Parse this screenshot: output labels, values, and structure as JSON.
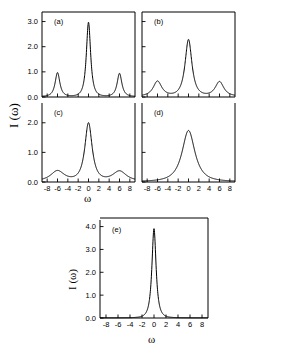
{
  "figure": {
    "ylabel": "I (ω)",
    "xlabel": "ω",
    "panels": [
      {
        "tag": "(a)"
      },
      {
        "tag": "(b)"
      },
      {
        "tag": "(c)"
      },
      {
        "tag": "(d)"
      },
      {
        "tag": "(e)"
      }
    ],
    "xticklabels": [
      "-8",
      "-6",
      "-4",
      "-2",
      "0",
      "2",
      "4",
      "6",
      "8"
    ],
    "yticklabels_top": [
      "0.0",
      "1.0",
      "2.0",
      "3.0"
    ],
    "yticklabels_bottom": [
      "0.0",
      "1.0",
      "2.0"
    ],
    "yticklabels_e": [
      "0.0",
      "1.0",
      "2.0",
      "3.0",
      "4.0"
    ]
  },
  "chart_data": {
    "type": "line",
    "title": "",
    "xlabel": "ω",
    "ylabel": "I (ω)",
    "xlim": [
      -9,
      9
    ],
    "xticks": [
      -8,
      -6,
      -4,
      -2,
      0,
      2,
      4,
      6,
      8
    ],
    "grid": false,
    "legend": null,
    "panels": [
      {
        "tag": "(a)",
        "ylim": [
          0,
          3.3
        ],
        "yticks": [
          0.0,
          1.0,
          2.0,
          3.0
        ],
        "description": "Well-resolved Mollow triplet: tall narrow central peak with two sharp symmetric sidebands",
        "peaks": [
          {
            "center": -6.0,
            "height": 0.95,
            "halfwidth": 0.55
          },
          {
            "center": 0.0,
            "height": 2.95,
            "halfwidth": 0.5
          },
          {
            "center": 6.0,
            "height": 0.92,
            "halfwidth": 0.55
          }
        ],
        "baseline": 0.02
      },
      {
        "tag": "(b)",
        "ylim": [
          0,
          3.3
        ],
        "yticks": [
          0.0,
          1.0,
          2.0,
          3.0
        ],
        "description": "Triplet with broadened, reduced central peak and lower sidebands",
        "peaks": [
          {
            "center": -6.0,
            "height": 0.6,
            "halfwidth": 1.0
          },
          {
            "center": 0.0,
            "height": 2.25,
            "halfwidth": 0.8
          },
          {
            "center": 6.0,
            "height": 0.58,
            "halfwidth": 1.0
          }
        ],
        "baseline": 0.03
      },
      {
        "tag": "(c)",
        "ylim": [
          0,
          2.6
        ],
        "yticks": [
          0.0,
          1.0,
          2.0
        ],
        "description": "Central peak reduced to about 2.0 with weak broad shoulders near plus and minus six",
        "peaks": [
          {
            "center": -6.0,
            "height": 0.35,
            "halfwidth": 1.6
          },
          {
            "center": 0.0,
            "height": 1.95,
            "halfwidth": 0.85
          },
          {
            "center": 6.0,
            "height": 0.34,
            "halfwidth": 1.6
          }
        ],
        "baseline": 0.03
      },
      {
        "tag": "(d)",
        "ylim": [
          0,
          2.6
        ],
        "yticks": [
          0.0,
          1.0,
          2.0
        ],
        "description": "Sidebands merged into the central line leaving a single cusped peak with broad tails",
        "peaks": [
          {
            "center": 0.0,
            "height": 1.72,
            "halfwidth": 1.5
          }
        ],
        "baseline": 0.02
      },
      {
        "tag": "(e)",
        "ylim": [
          0,
          4.2
        ],
        "yticks": [
          0.0,
          1.0,
          2.0,
          3.0,
          4.0
        ],
        "description": "Single tall narrow Lorentzian-like line centred at zero",
        "peaks": [
          {
            "center": 0.0,
            "height": 3.9,
            "halfwidth": 0.42
          }
        ],
        "baseline": 0.01
      }
    ]
  }
}
